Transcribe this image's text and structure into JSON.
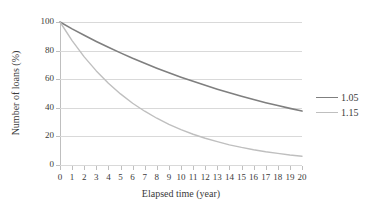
{
  "chart_data": {
    "type": "line",
    "title": "",
    "xlabel": "Elapsed time (year)",
    "ylabel": "Number of loans (%)",
    "xlim": [
      0,
      20
    ],
    "ylim": [
      0,
      100
    ],
    "grid": true,
    "legend_position": "right",
    "x": [
      0,
      1,
      2,
      3,
      4,
      5,
      6,
      7,
      8,
      9,
      10,
      11,
      12,
      13,
      14,
      15,
      16,
      17,
      18,
      19,
      20
    ],
    "xticklabels": [
      "0",
      "1",
      "2",
      "3",
      "4",
      "5",
      "6",
      "7",
      "8",
      "9",
      "10",
      "11",
      "12",
      "13",
      "14",
      "15",
      "16",
      "17",
      "18",
      "19",
      "20"
    ],
    "yticklabels": [
      "0",
      "20",
      "40",
      "60",
      "80",
      "100"
    ],
    "yticks": [
      0,
      20,
      40,
      60,
      80,
      100
    ],
    "series": [
      {
        "name": "1.05",
        "color": "#7f7f7f",
        "values": [
          100.0,
          95.2,
          90.7,
          86.4,
          82.3,
          78.4,
          74.6,
          71.1,
          67.7,
          64.5,
          61.4,
          58.5,
          55.7,
          53.0,
          50.5,
          48.1,
          45.8,
          43.6,
          41.6,
          39.6,
          37.7
        ]
      },
      {
        "name": "1.15",
        "color": "#bfbfbf",
        "values": [
          100.0,
          87.0,
          75.6,
          65.8,
          57.2,
          49.7,
          43.2,
          37.6,
          32.7,
          28.4,
          24.7,
          21.5,
          18.7,
          16.3,
          14.1,
          12.3,
          10.7,
          9.3,
          8.1,
          7.0,
          6.1
        ]
      }
    ]
  },
  "legend": {
    "entries": [
      {
        "label": "1.05",
        "color": "#7f7f7f"
      },
      {
        "label": "1.15",
        "color": "#bfbfbf"
      }
    ]
  },
  "colors": {
    "series_105": "#7f7f7f",
    "series_115": "#bfbfbf",
    "gridline": "#d9d9d9",
    "axis": "#bfbfbf",
    "text": "#3a3a3a",
    "background": "#ffffff"
  }
}
